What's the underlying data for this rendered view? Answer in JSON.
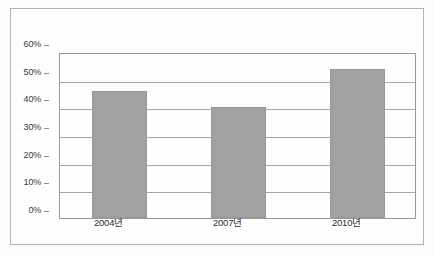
{
  "chart_data": {
    "type": "bar",
    "title": "",
    "subtitle": "",
    "xlabel": "",
    "ylabel": "",
    "categories": [
      "2004년",
      "2007년",
      "2010년"
    ],
    "values": [
      46,
      40,
      54
    ],
    "ylim": [
      0,
      60
    ],
    "ytick_values": [
      0,
      10,
      20,
      30,
      40,
      50,
      60
    ],
    "ytick_labels": [
      "0%",
      "10%",
      "20%",
      "30%",
      "40%",
      "50%",
      "60%"
    ],
    "grid": true,
    "legend": null,
    "legend_position": "none",
    "series": [
      {
        "name": "",
        "values": [
          46,
          40,
          54
        ],
        "color": "#a2a2a2"
      }
    ],
    "annotations": []
  },
  "style": {
    "bar_fill": "#a2a2a2",
    "bar_border": "#9a9a9a",
    "gridline_color": "#a8a8a8",
    "axis_color": "#9a9a9a",
    "frame_color": "#b4b4b4",
    "plot_background": "#ffffff",
    "figure_background": "#fdfdfd",
    "tick_label_color": "#3b3b3b"
  }
}
